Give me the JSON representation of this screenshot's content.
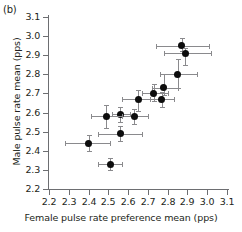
{
  "panel": {
    "label": "(b)"
  },
  "chart_data": {
    "type": "scatter",
    "title": "",
    "xlabel": "Female pulse rate preference mean (pps)",
    "ylabel": "Male pulse rate mean (pps)",
    "xlim": [
      2.2,
      3.1
    ],
    "ylim": [
      2.2,
      3.1
    ],
    "xticks": [
      "2.2",
      "2.3",
      "2.4",
      "2.5",
      "2.6",
      "2.7",
      "2.8",
      "2.9",
      "3.0",
      "3.1"
    ],
    "yticks": [
      "2.2",
      "2.3",
      "2.4",
      "2.5",
      "2.6",
      "2.7",
      "2.8",
      "2.9",
      "3.0",
      "3.1"
    ],
    "grid": false,
    "legend": null,
    "points": [
      {
        "x": 2.87,
        "y": 2.95,
        "xerr_low": 2.74,
        "xerr_high": 3.01,
        "yerr_low": 2.92,
        "yerr_high": 2.99
      },
      {
        "x": 2.89,
        "y": 2.91,
        "xerr_low": 2.78,
        "xerr_high": 3.02,
        "yerr_low": 2.85,
        "yerr_high": 2.94
      },
      {
        "x": 2.85,
        "y": 2.8,
        "xerr_low": 2.76,
        "xerr_high": 2.95,
        "yerr_low": 2.73,
        "yerr_high": 2.88
      },
      {
        "x": 2.78,
        "y": 2.73,
        "xerr_low": 2.72,
        "xerr_high": 2.85,
        "yerr_low": 2.69,
        "yerr_high": 2.8
      },
      {
        "x": 2.73,
        "y": 2.7,
        "xerr_low": 2.67,
        "xerr_high": 2.8,
        "yerr_low": 2.66,
        "yerr_high": 2.75
      },
      {
        "x": 2.77,
        "y": 2.67,
        "xerr_low": 2.71,
        "xerr_high": 2.83,
        "yerr_low": 2.63,
        "yerr_high": 2.71
      },
      {
        "x": 2.65,
        "y": 2.67,
        "xerr_low": 2.57,
        "xerr_high": 2.73,
        "yerr_low": 2.61,
        "yerr_high": 2.72
      },
      {
        "x": 2.63,
        "y": 2.58,
        "xerr_low": 2.56,
        "xerr_high": 2.7,
        "yerr_low": 2.54,
        "yerr_high": 2.62
      },
      {
        "x": 2.56,
        "y": 2.59,
        "xerr_low": 2.52,
        "xerr_high": 2.61,
        "yerr_low": 2.55,
        "yerr_high": 2.63
      },
      {
        "x": 2.49,
        "y": 2.58,
        "xerr_low": 2.41,
        "xerr_high": 2.57,
        "yerr_low": 2.52,
        "yerr_high": 2.64
      },
      {
        "x": 2.56,
        "y": 2.49,
        "xerr_low": 2.45,
        "xerr_high": 2.67,
        "yerr_low": 2.45,
        "yerr_high": 2.53
      },
      {
        "x": 2.4,
        "y": 2.44,
        "xerr_low": 2.28,
        "xerr_high": 2.51,
        "yerr_low": 2.4,
        "yerr_high": 2.48
      },
      {
        "x": 2.51,
        "y": 2.33,
        "xerr_low": 2.45,
        "xerr_high": 2.57,
        "yerr_low": 2.3,
        "yerr_high": 2.36
      }
    ]
  }
}
